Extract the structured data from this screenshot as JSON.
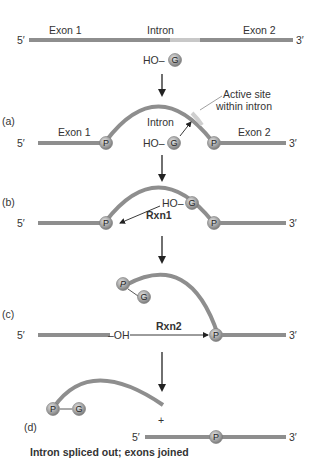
{
  "colors": {
    "strand": "#8e8e8e",
    "intron_strand": "#909090",
    "active_site": "#cfcfcf",
    "ball_fill": "#a9a9a9",
    "ball_stroke": "#7a7a7a",
    "arrow": "#222222",
    "text": "#333333"
  },
  "top": {
    "five_prime": "5′",
    "three_prime": "3′",
    "exon1": "Exon 1",
    "intron": "Intron",
    "exon2": "Exon 2",
    "ho": "HO–",
    "g": "G"
  },
  "a": {
    "label": "(a)",
    "five_prime": "5′",
    "three_prime": "3′",
    "exon1": "Exon 1",
    "intron": "Intron",
    "exon2": "Exon 2",
    "active_site": "Active site",
    "active_site2": "within intron",
    "p_left": "P",
    "p_right": "P",
    "ho": "HO–",
    "g": "G"
  },
  "b": {
    "label": "(b)",
    "five_prime": "5′",
    "three_prime": "3′",
    "ho": "HO–",
    "g": "G",
    "p_left": "P",
    "p_right": "P",
    "rxn": "Rxn1"
  },
  "c": {
    "label": "(c)",
    "five_prime": "5′",
    "three_prime": "3′",
    "oh": "–OH",
    "rxn": "Rxn2",
    "p_free": "P",
    "g": "G",
    "p_right": "P"
  },
  "d": {
    "label": "(d)",
    "p": "P",
    "g": "G",
    "plus": "+",
    "five_prime": "5′",
    "three_prime": "3′",
    "p_joined": "P",
    "caption": "Intron spliced out; exons joined"
  }
}
